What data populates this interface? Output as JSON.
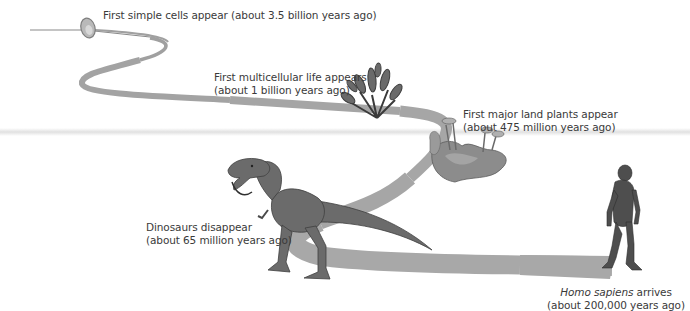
{
  "figure": {
    "type": "timeline-illustration",
    "colors": {
      "path": "#a6a6a6",
      "path_edge": "#8f8f8f",
      "text": "#3a3a3a",
      "background": "#ffffff"
    },
    "events": [
      {
        "id": "simple-cells",
        "line1": "First simple cells appear (about 3.5 billion years ago)",
        "line2": "",
        "icon": "cell-icon"
      },
      {
        "id": "multicellular",
        "line1": "First multicellular life appears",
        "line2": "(about 1 billion years ago)",
        "icon": "seaweed-icon"
      },
      {
        "id": "land-plants",
        "line1": "First major land plants appear",
        "line2": "(about 475 million years ago)",
        "icon": "land-plant-icon"
      },
      {
        "id": "dinosaurs",
        "line1": "Dinosaurs disappear",
        "line2": "(about 65 million years ago)",
        "icon": "t-rex-icon"
      },
      {
        "id": "homo-sapiens",
        "line1_italic": "Homo sapiens",
        "line1_rest": " arrives",
        "line2": "(about 200,000 years ago)",
        "icon": "human-icon"
      }
    ]
  }
}
